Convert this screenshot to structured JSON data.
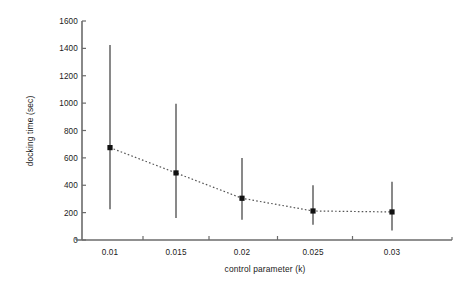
{
  "chart_data": {
    "type": "line",
    "title": "",
    "xlabel": "control parameter (k)",
    "ylabel": "docking time (sec)",
    "x": [
      0.01,
      0.015,
      0.02,
      0.025,
      0.03
    ],
    "xtick_labels": [
      "0.01",
      "0.015",
      "0.02",
      "0.025",
      "0.03"
    ],
    "ytick_labels": [
      "0",
      "200",
      "400",
      "600",
      "800",
      "1000",
      "1200",
      "1400",
      "1600"
    ],
    "ytick_values": [
      0,
      200,
      400,
      600,
      800,
      1000,
      1200,
      1400,
      1600
    ],
    "ylim": [
      0,
      1600
    ],
    "xlim": [
      0.0075,
      0.0325
    ],
    "grid": false,
    "legend": null,
    "series": [
      {
        "name": "docking time",
        "values": [
          675,
          490,
          305,
          212,
          205
        ],
        "error_upper": [
          1425,
          995,
          600,
          400,
          425
        ],
        "error_lower": [
          225,
          160,
          148,
          112,
          70
        ],
        "marker": "square",
        "linestyle": "dotted",
        "color": "#111111"
      }
    ],
    "colors": {
      "axis": "#6b6b6b",
      "marker": "#111111",
      "errorbar": "#4a4a4a",
      "trendline": "#555555",
      "background": "#ffffff",
      "text": "#1a1a1a"
    }
  }
}
